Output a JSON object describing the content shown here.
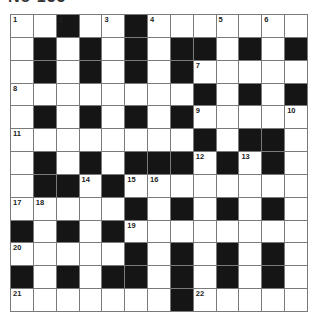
{
  "puzzle": {
    "title": "No 155",
    "rows": 13,
    "cols": 13,
    "colors": {
      "block": "#151515",
      "cell": "#ffffff",
      "gridline": "#7a7a7a"
    },
    "grid": [
      "..#..#.......",
      ".#.#.#.##.#.#",
      ".#.#.#.#.....",
      "........#.#.#",
      ".#.#.#.#.....",
      "........#.##.",
      ".#.#.###.#.#.",
      ".##.#........",
      ".....#.#.#.#.",
      "#.#.#........",
      ".....#.#.#.#.",
      "#.#.##.#.#.#.",
      ".......#....."
    ],
    "numbers": [
      {
        "r": 0,
        "c": 0,
        "n": "1"
      },
      {
        "r": 0,
        "c": 2,
        "n": "2"
      },
      {
        "r": 0,
        "c": 4,
        "n": "3"
      },
      {
        "r": 0,
        "c": 6,
        "n": "4"
      },
      {
        "r": 0,
        "c": 9,
        "n": "5"
      },
      {
        "r": 0,
        "c": 11,
        "n": "6"
      },
      {
        "r": 2,
        "c": 8,
        "n": "7"
      },
      {
        "r": 3,
        "c": 0,
        "n": "8"
      },
      {
        "r": 4,
        "c": 8,
        "n": "9"
      },
      {
        "r": 4,
        "c": 12,
        "n": "10"
      },
      {
        "r": 5,
        "c": 0,
        "n": "11"
      },
      {
        "r": 6,
        "c": 8,
        "n": "12"
      },
      {
        "r": 6,
        "c": 10,
        "n": "13"
      },
      {
        "r": 7,
        "c": 3,
        "n": "14"
      },
      {
        "r": 7,
        "c": 5,
        "n": "15"
      },
      {
        "r": 7,
        "c": 6,
        "n": "16"
      },
      {
        "r": 8,
        "c": 0,
        "n": "17"
      },
      {
        "r": 8,
        "c": 1,
        "n": "18"
      },
      {
        "r": 9,
        "c": 5,
        "n": "19"
      },
      {
        "r": 10,
        "c": 0,
        "n": "20"
      },
      {
        "r": 12,
        "c": 0,
        "n": "21"
      },
      {
        "r": 12,
        "c": 8,
        "n": "22"
      }
    ]
  }
}
